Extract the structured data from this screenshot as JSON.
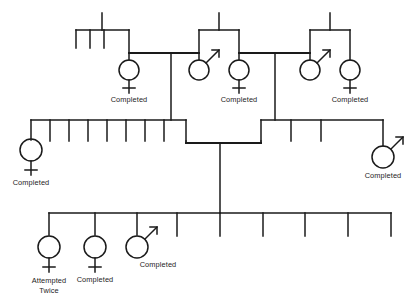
{
  "figure": {
    "kind": "pedigree-chart",
    "width": 415,
    "height": 306,
    "background_color": "#ffffff",
    "line_color": "#1a1a1a",
    "text_color": "#1c1c1c",
    "cropped_top_text": "",
    "generations": 3
  },
  "legend": {
    "female_symbol": "circle-with-cross",
    "male_symbol": "circle-with-arrow",
    "unaffected_symbol": "short-vertical-tick"
  },
  "labels": {
    "completed": "Completed",
    "attempted_twice_line1": "Attempted",
    "attempted_twice_line2": "Twice"
  },
  "generation_1": {
    "name": "top-generation",
    "sibships": [
      {
        "id": "g1-sibship-left",
        "tick_count": 3,
        "members": [
          {
            "id": "g1-left-female",
            "sex": "female",
            "label": "Completed"
          }
        ]
      },
      {
        "id": "g1-sibship-middle",
        "tick_count": 0,
        "members": [
          {
            "id": "g1-mid-male",
            "sex": "male",
            "label": ""
          },
          {
            "id": "g1-mid-female",
            "sex": "female",
            "label": "Completed"
          }
        ]
      },
      {
        "id": "g1-sibship-right",
        "tick_count": 0,
        "members": [
          {
            "id": "g1-right-male",
            "sex": "male",
            "label": ""
          },
          {
            "id": "g1-right-female",
            "sex": "female",
            "label": "Completed"
          }
        ]
      }
    ],
    "marriage_lines": 2
  },
  "generation_2": {
    "name": "middle-generation",
    "sibships": [
      {
        "id": "g2-sibship-left",
        "tick_count": 8,
        "members": [
          {
            "id": "g2-left-female",
            "sex": "female",
            "label": "Completed"
          }
        ]
      },
      {
        "id": "g2-sibship-right",
        "tick_count": 3,
        "members": [
          {
            "id": "g2-right-male",
            "sex": "male",
            "label": "Completed"
          }
        ]
      }
    ],
    "marriage_lines": 1
  },
  "generation_3": {
    "name": "bottom-generation",
    "sibships": [
      {
        "id": "g3-sibship",
        "tick_count": 6,
        "members": [
          {
            "id": "g3-female-1",
            "sex": "female",
            "label_line1": "Attempted",
            "label_line2": "Twice"
          },
          {
            "id": "g3-female-2",
            "sex": "female",
            "label": "Completed"
          },
          {
            "id": "g3-male-1",
            "sex": "male",
            "label": "Completed"
          }
        ]
      }
    ]
  }
}
